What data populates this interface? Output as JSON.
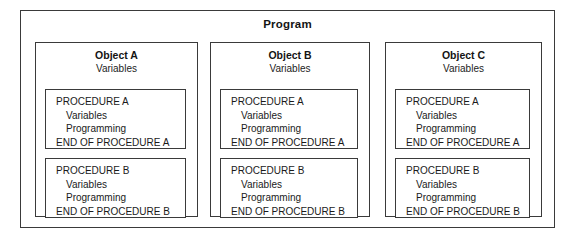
{
  "diagram": {
    "title": "Program",
    "objects": [
      {
        "name": "Object A",
        "subtitle": "Variables",
        "procedures": [
          {
            "header": "PROCEDURE A",
            "body": [
              "Variables",
              "Programming"
            ],
            "footer": "END OF PROCEDURE A"
          },
          {
            "header": "PROCEDURE B",
            "body": [
              "Variables",
              "Programming"
            ],
            "footer": "END OF PROCEDURE B"
          }
        ]
      },
      {
        "name": "Object B",
        "subtitle": "Variables",
        "procedures": [
          {
            "header": "PROCEDURE A",
            "body": [
              "Variables",
              "Programming"
            ],
            "footer": "END OF PROCEDURE A"
          },
          {
            "header": "PROCEDURE B",
            "body": [
              "Variables",
              "Programming"
            ],
            "footer": "END OF PROCEDURE B"
          }
        ]
      },
      {
        "name": "Object C",
        "subtitle": "Variables",
        "procedures": [
          {
            "header": "PROCEDURE A",
            "body": [
              "Variables",
              "Programming"
            ],
            "footer": "END OF PROCEDURE A"
          },
          {
            "header": "PROCEDURE B",
            "body": [
              "Variables",
              "Programming"
            ],
            "footer": "END OF PROCEDURE B"
          }
        ]
      }
    ]
  },
  "colors": {
    "border": "#3a3a3a",
    "text": "#1a1a1a",
    "background": "#ffffff"
  }
}
